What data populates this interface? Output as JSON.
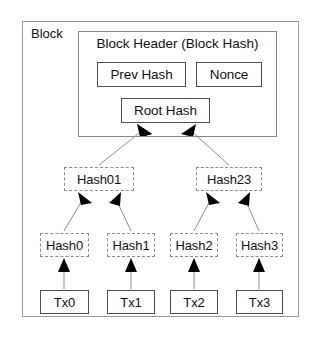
{
  "diagram": {
    "block_label": "Block",
    "header_title": "Block Header (Block Hash)",
    "header_fields": [
      {
        "id": "prev-hash",
        "label": "Prev Hash"
      },
      {
        "id": "nonce",
        "label": "Nonce"
      },
      {
        "id": "root-hash",
        "label": "Root Hash"
      }
    ],
    "merkle_level_1": [
      {
        "id": "hash01",
        "label": "Hash01"
      },
      {
        "id": "hash23",
        "label": "Hash23"
      }
    ],
    "merkle_level_0": [
      {
        "id": "hash0",
        "label": "Hash0"
      },
      {
        "id": "hash1",
        "label": "Hash1"
      },
      {
        "id": "hash2",
        "label": "Hash2"
      },
      {
        "id": "hash3",
        "label": "Hash3"
      }
    ],
    "transactions": [
      {
        "id": "tx0",
        "label": "Tx0"
      },
      {
        "id": "tx1",
        "label": "Tx1"
      },
      {
        "id": "tx2",
        "label": "Tx2"
      },
      {
        "id": "tx3",
        "label": "Tx3"
      }
    ],
    "edges": [
      {
        "from": "hash01",
        "to": "root-hash"
      },
      {
        "from": "hash23",
        "to": "root-hash"
      },
      {
        "from": "hash0",
        "to": "hash01"
      },
      {
        "from": "hash1",
        "to": "hash01"
      },
      {
        "from": "hash2",
        "to": "hash23"
      },
      {
        "from": "hash3",
        "to": "hash23"
      },
      {
        "from": "tx0",
        "to": "hash0"
      },
      {
        "from": "tx1",
        "to": "hash1"
      },
      {
        "from": "tx2",
        "to": "hash2"
      },
      {
        "from": "tx3",
        "to": "hash3"
      }
    ],
    "colors": {
      "background": "#ffffff",
      "text": "#111111",
      "solid_border": "#4d4d4d",
      "dashed_border": "#8c8c8c",
      "frame_border": "#9a9a9a",
      "edge_line": "#8e8e8e",
      "arrow_head": "#000000"
    }
  }
}
